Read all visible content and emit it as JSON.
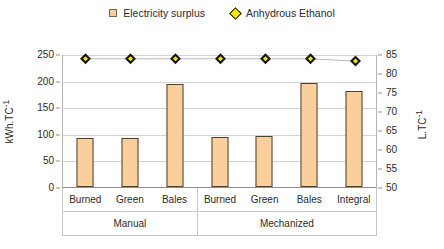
{
  "chart_data": {
    "type": "bar",
    "title": "",
    "xlabel": "",
    "ylabel": "kWh.TC-1",
    "categories": [
      "Burned",
      "Green",
      "Bales",
      "Burned",
      "Green",
      "Bales",
      "Integral"
    ],
    "groups": [
      {
        "label": "Manual",
        "span": 3
      },
      {
        "label": "Mechanized",
        "span": 4
      }
    ],
    "series": [
      {
        "name": "Electricity surplus",
        "axis": "left",
        "type": "bar",
        "color": "#F9CF9B",
        "edge_color": "#4A4133",
        "values": [
          93,
          93,
          193,
          94,
          95,
          196,
          181
        ]
      },
      {
        "name": "Anhydrous Ethanol",
        "axis": "right",
        "type": "scatter",
        "color": "#F2E41F",
        "edge_color": "#17160B",
        "values": [
          84,
          84,
          84,
          84,
          84,
          84,
          83.4
        ]
      }
    ],
    "left_axis": {
      "label": "kWh.TC-1",
      "ticks": [
        0,
        50,
        100,
        150,
        200,
        250
      ],
      "ylim": [
        0,
        250
      ]
    },
    "right_axis": {
      "label": "L.TC-1",
      "ticks": [
        50,
        55,
        60,
        65,
        70,
        75,
        80,
        85
      ],
      "ylim": [
        50,
        85
      ]
    },
    "grid": true,
    "legend_position": "top-center"
  },
  "legend": {
    "entries": [
      {
        "label": "Electricity surplus",
        "marker": "square-swatch"
      },
      {
        "label": "Anhydrous Ethanol",
        "marker": "diamond-swatch"
      }
    ]
  },
  "axis_titles": {
    "left": "kWh.TC-1",
    "left_base": "kWh.TC",
    "left_sup": "-1",
    "right": "L.TC-1",
    "right_base": "L.TC",
    "right_sup": "-1"
  }
}
